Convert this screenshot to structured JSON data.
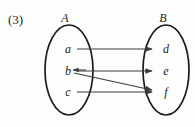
{
  "figure": {
    "number_label": "(3)",
    "type": "mapping-diagram",
    "background_color": "#fdfdfb",
    "line_color": "#3a3a3a",
    "oval_color": "#1a1a1a",
    "text_color": "#1c1c1c"
  },
  "sets": [
    {
      "name": "A",
      "label": "A",
      "side": "left",
      "elements": [
        {
          "label": "a"
        },
        {
          "label": "b"
        },
        {
          "label": "c"
        }
      ]
    },
    {
      "name": "B",
      "label": "B",
      "side": "right",
      "elements": [
        {
          "label": "d"
        },
        {
          "label": "e"
        },
        {
          "label": "f"
        }
      ]
    }
  ],
  "arrows": [
    {
      "from": "a",
      "to": "d",
      "style": "horizontal",
      "head": "right"
    },
    {
      "from": "b",
      "to": "e",
      "style": "horizontal",
      "head": "right"
    },
    {
      "from": "b",
      "to": "f",
      "style": "diagonal-down",
      "head": "right"
    },
    {
      "from": "c",
      "to": "f",
      "style": "horizontal",
      "head": "right"
    },
    {
      "from": "b",
      "to": "b",
      "style": "tick",
      "head": "left"
    }
  ]
}
